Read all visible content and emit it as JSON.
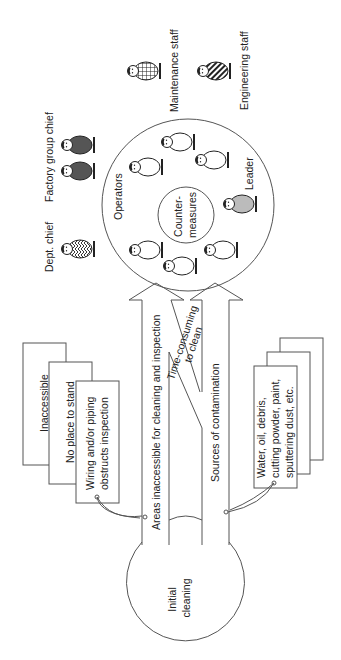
{
  "diagram": {
    "orientation": "rotated-90-ccw",
    "start": {
      "label_line1": "Initial",
      "label_line2": "cleaning"
    },
    "center": {
      "outer_label": "Operators",
      "inner_label_line1": "Counter-",
      "inner_label_line2": "measures",
      "leader_label": "Leader"
    },
    "people": {
      "dept_chief": "Dept. chief",
      "factory_group_chief": "Factory group chief",
      "maintenance_staff": "Maintenance staff",
      "engineering_staff": "Engineering staff"
    },
    "arrows": {
      "left": "Areas inaccessible for cleaning and inspection",
      "middle_line1": "Time-consuming",
      "middle_line2": "to clean",
      "right": "Sources of contamination"
    },
    "left_cards": [
      {
        "line1": "Inaccessible",
        "line2": ""
      },
      {
        "line1": "No place to stand",
        "line2": ""
      },
      {
        "line1": "Wiring and/or piping",
        "line2": "obstructs inspection"
      }
    ],
    "right_card": {
      "line1": "Water, oil, debris,",
      "line2": "cutting powder, paint,",
      "line3": "sputtering dust, etc."
    },
    "colors": {
      "line": "#555555",
      "factory_chief_fill": "#555555",
      "leader_fill": "#bbbbbb",
      "operator_fill": "#ffffff"
    }
  }
}
